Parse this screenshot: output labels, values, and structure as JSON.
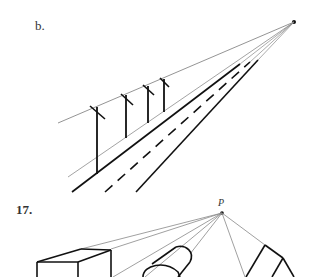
{
  "figures": [
    {
      "label": "b.",
      "description": "One-point perspective of a road with telephone poles converging to a single vanishing point",
      "vanishing_point": {
        "x": 294,
        "y": 22
      },
      "elements": [
        "upper wire line",
        "4 telephone poles with crossbars",
        "ground edge line",
        "solid road edge",
        "dashed center line",
        "solid road edge"
      ]
    },
    {
      "label": "17.",
      "point_label": "P",
      "description": "Perspective construction: box, cylinder and prism with projection lines converging to point P",
      "vanishing_point": {
        "x": 222,
        "y": 213
      },
      "elements": [
        "box",
        "cylinder",
        "triangular prism",
        "projection lines to P"
      ]
    }
  ],
  "colors": {
    "ink": "#111111",
    "thin_line": "#888888",
    "label": "#333333"
  }
}
